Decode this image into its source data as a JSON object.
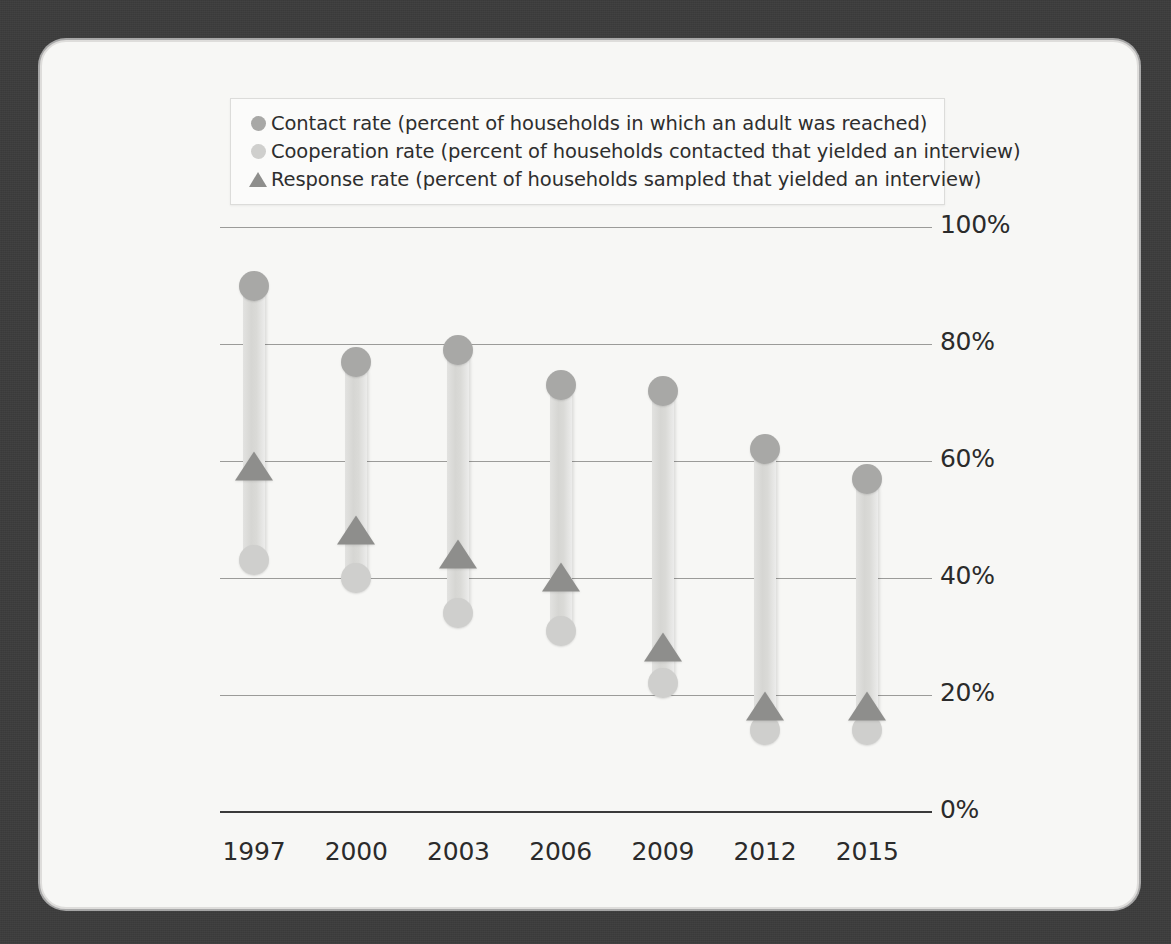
{
  "figure": {
    "background_color": "#3c3c3c",
    "card_color": "#f7f7f5"
  },
  "legend": {
    "items": [
      {
        "marker": "circle",
        "marker_name": "contact-rate-marker",
        "color": "#a8a8a6",
        "label": "Contact rate (percent of households in which an adult was reached)"
      },
      {
        "marker": "circle",
        "marker_name": "cooperation-rate-marker",
        "color": "#cfcfcd",
        "label": "Cooperation rate (percent of households contacted that yielded an interview)"
      },
      {
        "marker": "triangle",
        "marker_name": "response-rate-marker",
        "color": "#8e8e8c",
        "label": "Response rate (percent of households sampled that yielded an interview)"
      }
    ]
  },
  "axes": {
    "y_ticks": [
      "0%",
      "20%",
      "40%",
      "60%",
      "80%",
      "100%"
    ],
    "y_tick_values": [
      0,
      20,
      40,
      60,
      80,
      100
    ],
    "x_ticks": [
      "1997",
      "2000",
      "2003",
      "2006",
      "2009",
      "2012",
      "2015"
    ]
  },
  "chart_data": {
    "type": "bar",
    "title": "",
    "subtitle": "",
    "xlabel": "",
    "ylabel": "",
    "ylim": [
      0,
      100
    ],
    "grid": true,
    "legend_position": "top",
    "categories": [
      "1997",
      "2000",
      "2003",
      "2006",
      "2009",
      "2012",
      "2015"
    ],
    "series": [
      {
        "name": "Contact rate (percent of households in which an adult was reached)",
        "marker": "circle",
        "color": "#a8a8a6",
        "values": [
          90,
          77,
          79,
          73,
          72,
          62,
          57
        ]
      },
      {
        "name": "Cooperation rate (percent of households contacted that yielded an interview)",
        "marker": "circle",
        "color": "#cfcfcd",
        "values": [
          43,
          40,
          34,
          31,
          22,
          14,
          14
        ]
      },
      {
        "name": "Response rate (percent of households sampled that yielded an interview)",
        "marker": "triangle",
        "color": "#8e8e8c",
        "values": [
          60,
          49,
          45,
          41,
          29,
          19,
          19
        ]
      }
    ]
  }
}
